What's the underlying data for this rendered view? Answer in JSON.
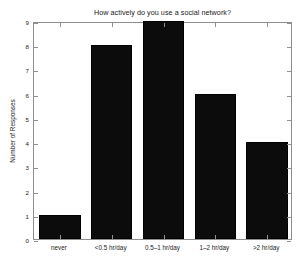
{
  "chart_data": {
    "type": "bar",
    "title": "How actively do you use a social network?",
    "xlabel": "",
    "ylabel": "Number of Responses",
    "categories": [
      "never",
      "<0.5 hr/day",
      "0.5–1 hr/day",
      "1–2 hr/day",
      ">2 hr/day"
    ],
    "values": [
      1,
      8,
      9,
      6,
      4
    ],
    "ylim": [
      0,
      9
    ],
    "yticks": [
      0,
      1,
      2,
      3,
      4,
      5,
      6,
      7,
      8,
      9
    ],
    "ytick_labels": [
      "0",
      "1",
      "2",
      "3",
      "4",
      "5",
      "6",
      "7",
      "8",
      "9"
    ],
    "grid": false,
    "legend": null,
    "bar_color": "#0c0c0c",
    "axis_color": "#8e8e8e",
    "background": "#ffffff"
  }
}
